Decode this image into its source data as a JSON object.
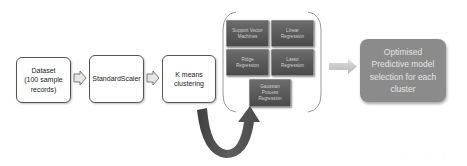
{
  "diagram": {
    "type": "flowchart",
    "colors": {
      "box_border": "#555555",
      "model_box_fill": "#5a5a5a",
      "result_fill": "#8b8b8b",
      "curved_arrow": "#4f4f4f",
      "step_arrow": "#c8c8c8"
    },
    "steps": [
      {
        "id": "dataset",
        "label": "Dataset\n(100 sample\nrecords)"
      },
      {
        "id": "scaler",
        "label": "StandardScaler"
      },
      {
        "id": "kmeans",
        "label": "K means\nclustering"
      }
    ],
    "models": [
      {
        "id": "svm",
        "label": "Support Vector\nMachines"
      },
      {
        "id": "linear",
        "label": "Linear\nRegression"
      },
      {
        "id": "ridge",
        "label": "Ridge\nRegression"
      },
      {
        "id": "lasso",
        "label": "Lasso\nRegression"
      },
      {
        "id": "gaussian",
        "label": "Gaussian\nProcess\nRegression"
      }
    ],
    "result": {
      "label": "Optimised\nPredictive model\nselection for each\ncluster"
    },
    "footer_text": "· · ·   · ·   · · · ·"
  }
}
